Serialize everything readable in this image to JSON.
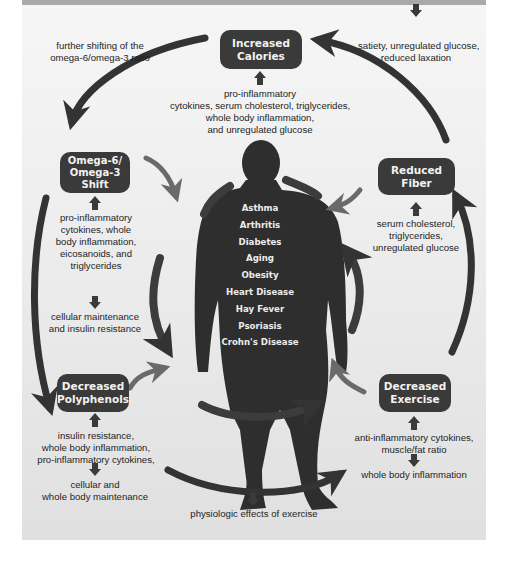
{
  "diagram": {
    "colors": {
      "box_fill": "#3a3a3a",
      "arrow_dark": "#333333",
      "arrow_light": "#6a6a6a",
      "silhouette": "#2e2e2e",
      "text": "#1e1e1e",
      "box_text": "#f2f2f2"
    },
    "nodes": {
      "increased_calories": {
        "lines": [
          "Increased",
          "Calories"
        ]
      },
      "reduced_fiber": {
        "lines": [
          "Reduced",
          "Fiber"
        ]
      },
      "omega_shift": {
        "lines": [
          "Omega-6/",
          "Omega-3",
          "Shift"
        ]
      },
      "decreased_polyphenols": {
        "lines": [
          "Decreased",
          "Polyphenols"
        ]
      },
      "decreased_exercise": {
        "lines": [
          "Decreased",
          "Exercise"
        ]
      }
    },
    "notes": {
      "omega_ratio": [
        "further shifting of the",
        "omega-6/omega-3 ratio"
      ],
      "satiety": [
        "satiety, unregulated glucose,",
        "reduced laxation"
      ],
      "calories_effects": [
        "pro-inflammatory",
        "cytokines, serum cholesterol, triglycerides,",
        "whole body inflammation,",
        "and unregulated glucose"
      ],
      "omega_effects": [
        "pro-inflammatory",
        "cytokines, whole",
        "body inflammation,",
        "eicosanoids, and",
        "triglycerides"
      ],
      "cellular_insulin": [
        "cellular maintenance",
        "and insulin resistance"
      ],
      "fiber_effects": [
        "serum cholesterol,",
        "triglycerides,",
        "unregulated glucose"
      ],
      "polyphenol_effects": [
        "insulin resistance,",
        "whole body inflammation,",
        "pro-inflammatory cytokines,"
      ],
      "polyphenol_maintenance": [
        "cellular and",
        "whole body maintenance"
      ],
      "exercise_effects": [
        "anti-inflammatory cytokines,",
        "muscle/fat ratio"
      ],
      "exercise_inflammation": [
        "whole body inflammation"
      ],
      "physiologic": [
        "physiologic effects of exercise"
      ]
    },
    "diseases": [
      "Asthma",
      "Arthritis",
      "Diabetes",
      "Aging",
      "Obesity",
      "Heart Disease",
      "Hay Fever",
      "Psoriasis",
      "Crohn's Disease"
    ]
  }
}
